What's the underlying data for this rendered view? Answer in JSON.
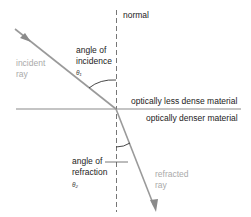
{
  "diagram": {
    "labels": {
      "normal": "normal",
      "incident_ray_1": "incident",
      "incident_ray_2": "ray",
      "angle_incidence_1": "angle of",
      "angle_incidence_2": "incidence",
      "theta1": "θ₁",
      "less_dense": "optically less dense material",
      "denser": "optically denser material",
      "angle_refraction_1": "angle of",
      "angle_refraction_2": "refraction",
      "theta2": "θ₂",
      "refracted_ray_1": "refracted",
      "refracted_ray_2": "ray"
    },
    "colors": {
      "ray": "#9a9a9a",
      "boundary": "#888888",
      "normal": "#666666",
      "text": "#222222",
      "ray_label": "#aaaaaa"
    }
  }
}
